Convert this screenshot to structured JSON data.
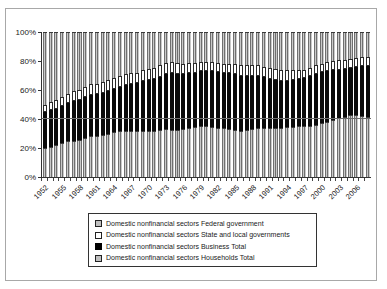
{
  "figure": {
    "background": "#ffffff",
    "border_color": "#a8a8a8"
  },
  "chart_data": {
    "type": "bar",
    "stacked": true,
    "normalized_100pct": true,
    "title": "",
    "xlabel": "",
    "ylabel": "",
    "ylim": [
      0,
      100
    ],
    "grid": "single line at 40%",
    "gridline_value": 40,
    "legend_position": "bottom",
    "years": [
      1952,
      1953,
      1954,
      1955,
      1956,
      1957,
      1958,
      1959,
      1960,
      1961,
      1962,
      1963,
      1964,
      1965,
      1966,
      1967,
      1968,
      1969,
      1970,
      1971,
      1972,
      1973,
      1974,
      1975,
      1976,
      1977,
      1978,
      1979,
      1980,
      1981,
      1982,
      1983,
      1984,
      1985,
      1986,
      1987,
      1988,
      1989,
      1990,
      1991,
      1992,
      1993,
      1994,
      1995,
      1996,
      1997,
      1998,
      1999,
      2000,
      2001,
      2002,
      2003,
      2004,
      2005,
      2006,
      2007,
      2008
    ],
    "x_tick_labels": [
      "1952",
      "1955",
      "1958",
      "1961",
      "1964",
      "1967",
      "1970",
      "1973",
      "1976",
      "1979",
      "1982",
      "1985",
      "1988",
      "1991",
      "1994",
      "1997",
      "2000",
      "2003",
      "2006"
    ],
    "x_tick_years": [
      1952,
      1955,
      1958,
      1961,
      1964,
      1967,
      1970,
      1973,
      1976,
      1979,
      1982,
      1985,
      1988,
      1991,
      1994,
      1997,
      2000,
      2003,
      2006
    ],
    "y_ticks": [
      {
        "label": "0%",
        "value": 0
      },
      {
        "label": "20%",
        "value": 20
      },
      {
        "label": "40%",
        "value": 40
      },
      {
        "label": "60%",
        "value": 60
      },
      {
        "label": "80%",
        "value": 80
      },
      {
        "label": "100%",
        "value": 100
      }
    ],
    "series": [
      {
        "name": "Domestic nonfinancial sectors Households Total",
        "swatch": "gray-pattern",
        "values": [
          20,
          21,
          22,
          23.5,
          24.5,
          25,
          25.5,
          27,
          28,
          28.5,
          29,
          30,
          31,
          31.5,
          31.5,
          31.5,
          31.5,
          32,
          31.5,
          31.5,
          32.5,
          33,
          32.5,
          32.5,
          33,
          33.5,
          34.5,
          35,
          35,
          34.5,
          34,
          33.5,
          33,
          32.5,
          32,
          32.5,
          33,
          33.5,
          33.5,
          33.5,
          34,
          34,
          34.5,
          34.5,
          35,
          35,
          35.5,
          36,
          37,
          38,
          39.5,
          41,
          41.5,
          42.5,
          42.5,
          42,
          41.5
        ]
      },
      {
        "name": "Domestic nonfinancial sectors Business Total",
        "swatch": "black",
        "values": [
          25,
          25,
          25,
          25.5,
          26.5,
          27.5,
          27.5,
          28,
          28.5,
          28.5,
          29,
          29,
          29.5,
          30.5,
          32,
          32.5,
          33,
          34.5,
          35.5,
          36,
          36.5,
          38,
          39.5,
          38.5,
          38,
          38,
          37.5,
          38,
          38,
          38.5,
          38.5,
          38,
          38.5,
          38.5,
          38,
          37.5,
          37,
          36.5,
          35.5,
          34,
          33,
          32.5,
          32,
          32.5,
          32.5,
          33,
          34,
          35,
          35.5,
          35,
          34,
          33,
          33,
          33,
          33.5,
          34.5,
          35
        ]
      },
      {
        "name": "Domestic nonfinancial sectors State and local governments",
        "swatch": "white",
        "values": [
          5,
          5.5,
          6,
          6,
          6,
          6.5,
          7,
          7,
          7.5,
          7.5,
          7.5,
          8,
          8,
          8,
          7.5,
          7.5,
          7.5,
          7.5,
          7.5,
          8,
          8,
          7.5,
          7.5,
          7.5,
          7,
          7,
          6.5,
          6,
          6,
          6,
          6,
          6.5,
          6.5,
          7,
          7.5,
          7.5,
          7,
          7,
          7,
          7.5,
          7.5,
          7.5,
          7,
          6.5,
          6.5,
          6,
          6,
          6,
          5.5,
          6,
          6.5,
          6.5,
          6.5,
          6,
          6,
          6,
          6
        ]
      },
      {
        "name": "Domestic nonfinancial sectors Federal government",
        "swatch": "gray-pattern",
        "values": [
          50,
          48.5,
          47,
          45,
          43,
          41,
          40,
          38,
          36,
          35.5,
          34.5,
          33,
          31.5,
          30,
          29,
          28.5,
          28,
          26,
          25.5,
          24.5,
          23,
          21.5,
          20.5,
          21.5,
          22,
          21.5,
          21.5,
          21,
          21,
          21,
          21.5,
          22,
          22,
          22,
          22.5,
          22.5,
          23,
          23,
          24,
          25,
          25.5,
          26,
          26.5,
          26.5,
          26,
          26,
          24.5,
          23,
          22,
          21,
          20,
          19.5,
          19,
          18.5,
          18,
          17.5,
          17.5
        ]
      }
    ]
  },
  "legend": {
    "items": [
      {
        "label": "Domestic nonfinancial sectors Federal government",
        "swatch": "gray-pattern"
      },
      {
        "label": "Domestic nonfinancial sectors State and local governments",
        "swatch": "white"
      },
      {
        "label": "Domestic nonfinancial sectors Business Total",
        "swatch": "black"
      },
      {
        "label": "Domestic nonfinancial sectors Households Total",
        "swatch": "gray-pattern"
      }
    ]
  }
}
